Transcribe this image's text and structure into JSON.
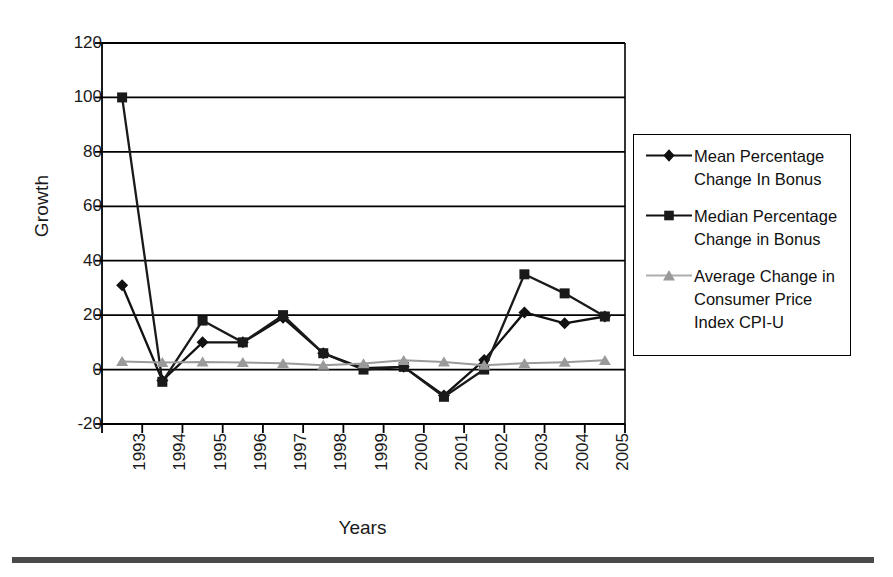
{
  "chart_data": {
    "type": "line",
    "title": "",
    "xlabel": "Years",
    "ylabel": "Growth",
    "categories": [
      "1993",
      "1994",
      "1995",
      "1996",
      "1997",
      "1998",
      "1999",
      "2000",
      "2001",
      "2002",
      "2003",
      "2004",
      "2005"
    ],
    "ylim": [
      -20,
      120
    ],
    "yticks": [
      120,
      100,
      80,
      60,
      40,
      20,
      0,
      -20
    ],
    "ytick_labels": [
      "120",
      "100",
      "80",
      "60",
      "40",
      "20",
      "0",
      "-20"
    ],
    "grid": "horizontal",
    "legend_position": "right",
    "series": [
      {
        "name": "Mean Percentage Change In Bonus",
        "marker": "diamond",
        "color": "#111111",
        "values": [
          31,
          -4,
          10,
          10,
          19,
          6,
          0.5,
          1,
          -9.5,
          3.5,
          21,
          17,
          19.5
        ]
      },
      {
        "name": "Median Percentage Change in Bonus",
        "marker": "square",
        "color": "#1a1a1a",
        "values": [
          100,
          -4.5,
          18,
          10,
          20,
          6,
          0,
          1,
          -10,
          0,
          35,
          28,
          19.5
        ]
      },
      {
        "name": "Average Change in Consumer Price Index CPI-U",
        "marker": "triangle",
        "color": "#9a9a9a",
        "values": [
          3,
          2.6,
          2.8,
          2.6,
          2.3,
          1.6,
          2.2,
          3.4,
          2.8,
          1.6,
          2.3,
          2.7,
          3.4
        ]
      }
    ]
  },
  "legend": {
    "items": [
      {
        "label_line1": "Mean Percentage",
        "label_line2": "Change In Bonus",
        "label_line3": ""
      },
      {
        "label_line1": "Median Percentage",
        "label_line2": "Change in Bonus",
        "label_line3": ""
      },
      {
        "label_line1": "Average Change in",
        "label_line2": "Consumer Price",
        "label_line3": "Index CPI-U"
      }
    ]
  },
  "axis_titles": {
    "y": "Growth",
    "x": "Years"
  }
}
